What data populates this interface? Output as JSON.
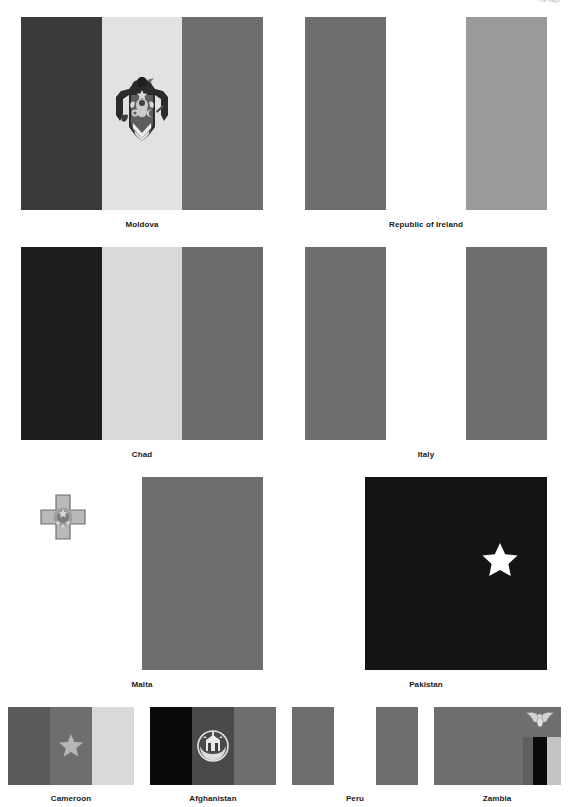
{
  "page": {
    "watermark": "The flags",
    "background": "#ffffff",
    "width": 568,
    "height": 807,
    "caption_color": "#1a1a1a"
  },
  "palette": {
    "dark_navy": "#3a3a3a",
    "very_dark": "#1d1d1d",
    "black": "#050505",
    "pale_yellow": "#e2e2e2",
    "light_gray": "#d9d9d9",
    "mid_gray": "#6e6e6e",
    "mid_gray_2": "#6b6b6b",
    "light_mid_gray": "#9a9a9a",
    "white": "#ffffff",
    "emblem_gray": "#8c8c8c",
    "star_gray": "#b5b5b5"
  },
  "rows": [
    {
      "name": "row-1",
      "flag_width": 242,
      "flag_height": 193,
      "cells": [
        {
          "name": "moldova",
          "caption": "Moldova",
          "type": "vertical-triband",
          "stripes": [
            "#3a3a3a",
            "#e2e2e2",
            "#6e6e6e"
          ],
          "emblem": "moldova-coat-of-arms",
          "emblem_visible": true
        },
        {
          "name": "republic-of-ireland",
          "caption": "Republic of Ireland",
          "type": "vertical-triband",
          "stripes": [
            "#6e6e6e",
            "#ffffff",
            "#9a9a9a"
          ],
          "emblem": "none",
          "emblem_visible": false
        }
      ]
    },
    {
      "name": "row-2",
      "flag_width": 242,
      "flag_height": 193,
      "cells": [
        {
          "name": "chad",
          "caption": "Chad",
          "type": "vertical-triband",
          "stripes": [
            "#1d1d1d",
            "#d9d9d9",
            "#6b6b6b"
          ],
          "emblem": "none",
          "emblem_visible": false
        },
        {
          "name": "italy",
          "caption": "Italy",
          "type": "vertical-triband",
          "stripes": [
            "#6e6e6e",
            "#ffffff",
            "#6e6e6e"
          ],
          "emblem": "none",
          "emblem_visible": false
        }
      ]
    },
    {
      "name": "row-3",
      "flag_width": 242,
      "flag_height": 193,
      "cells": [
        {
          "name": "malta",
          "caption": "Malta",
          "type": "vertical-bicolor",
          "stripes": [
            "#ffffff",
            "#6e6e6e"
          ],
          "emblem": "george-cross",
          "emblem_visible": true
        },
        {
          "name": "pakistan",
          "caption": "Pakistan",
          "type": "hoist-band-crescent",
          "stripes": [
            "#ffffff",
            "#141414"
          ],
          "emblem": "crescent-and-star",
          "emblem_visible": true
        }
      ]
    },
    {
      "name": "row-4",
      "flag_width": 127,
      "flag_height": 78,
      "cells": [
        {
          "name": "cameroon",
          "caption": "Cameroon",
          "type": "vertical-triband",
          "stripes": [
            "#5a5a5a",
            "#6e6e6e",
            "#d9d9d9"
          ],
          "emblem": "star",
          "emblem_visible": true
        },
        {
          "name": "afghanistan",
          "caption": "Afghanistan",
          "type": "vertical-triband",
          "stripes": [
            "#0a0a0a",
            "#4a4a4a",
            "#6e6e6e"
          ],
          "emblem": "afghanistan-emblem",
          "emblem_visible": true
        },
        {
          "name": "peru",
          "caption": "Peru",
          "type": "vertical-triband",
          "stripes": [
            "#6e6e6e",
            "#ffffff",
            "#6e6e6e"
          ],
          "emblem": "none",
          "emblem_visible": false
        },
        {
          "name": "zambia",
          "caption": "Zambia",
          "type": "field-with-corner-stripes",
          "field": "#6e6e6e",
          "corner_stripes": [
            "#5f5f5f",
            "#0a0a0a",
            "#c4c4c4"
          ],
          "emblem": "eagle",
          "emblem_visible": true
        }
      ]
    }
  ]
}
